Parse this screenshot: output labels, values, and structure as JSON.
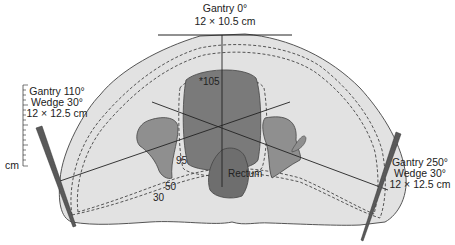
{
  "figure": {
    "type": "radiotherapy isodose treatment plan (axial pelvis)",
    "colors": {
      "body": "#e2e2e2",
      "body_outline": "#555555",
      "target": "#7a7a7a",
      "bone": "#8f8f8f",
      "rectum": "#6e6e6e",
      "wedge": "#5a5a5a",
      "line": "#222222"
    }
  },
  "beams": {
    "anterior": {
      "gantry": "Gantry 0°",
      "field_size": "12 × 10.5 cm"
    },
    "left_lateral": {
      "gantry": "Gantry 110°",
      "wedge": "Wedge 30°",
      "field_size": "12 × 12.5 cm"
    },
    "right_lateral": {
      "gantry": "Gantry 250°",
      "wedge": "Wedge 30°",
      "field_size": "12 × 12.5 cm"
    }
  },
  "isodose": {
    "max_point": "*105",
    "levels": [
      "95",
      "50",
      "30"
    ]
  },
  "structures": {
    "rectum": "Rectum"
  },
  "scale": {
    "unit": "cm"
  }
}
